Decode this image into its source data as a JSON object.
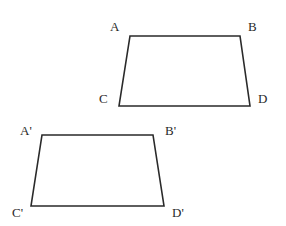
{
  "figure": {
    "width": 286,
    "height": 226,
    "stroke_color": "#2a2a2a",
    "background": "#ffffff"
  },
  "shapes": [
    {
      "name": "quadrilateral-ABCD",
      "vertices": [
        {
          "label": "A",
          "x": 130,
          "y": 36,
          "label_x": 110,
          "label_y": 31
        },
        {
          "label": "B",
          "x": 240,
          "y": 36,
          "label_x": 248,
          "label_y": 31
        },
        {
          "label": "D",
          "x": 250,
          "y": 106,
          "label_x": 258,
          "label_y": 103
        },
        {
          "label": "C",
          "x": 119,
          "y": 106,
          "label_x": 99,
          "label_y": 103
        }
      ]
    },
    {
      "name": "quadrilateral-A'B'C'D'",
      "vertices": [
        {
          "label": "A'",
          "x": 42,
          "y": 135,
          "label_x": 20,
          "label_y": 135
        },
        {
          "label": "B'",
          "x": 153,
          "y": 135,
          "label_x": 165,
          "label_y": 135
        },
        {
          "label": "D'",
          "x": 164,
          "y": 206,
          "label_x": 172,
          "label_y": 217
        },
        {
          "label": "C'",
          "x": 31,
          "y": 206,
          "label_x": 12,
          "label_y": 217
        }
      ]
    }
  ]
}
